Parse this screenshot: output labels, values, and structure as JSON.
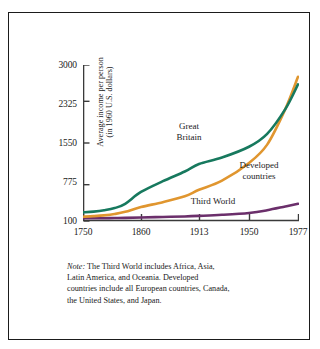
{
  "chart_data": {
    "type": "line",
    "title": "",
    "xlabel": "",
    "ylabel": "Average income per person (in 1960 U.S. dollars)",
    "ylabel_line1": "Average income per person",
    "ylabel_line2": "(in 1960 U.S. dollars)",
    "x_tick_labels": [
      "1750",
      "1860",
      "1913",
      "1950",
      "1977"
    ],
    "x_tick_values": [
      1750,
      1860,
      1913,
      1950,
      1977
    ],
    "y_tick_labels": [
      "100",
      "775",
      "1550",
      "2325",
      "3000"
    ],
    "y_tick_values": [
      100,
      775,
      1550,
      2325,
      3000
    ],
    "xlim": [
      1750,
      1977
    ],
    "ylim": [
      100,
      3000
    ],
    "grid": false,
    "legend_position": "inline-annotations",
    "series": [
      {
        "name": "Great Britain",
        "color": "#17795e",
        "x": [
          1750,
          1770,
          1790,
          1810,
          1830,
          1860,
          1880,
          1900,
          1913,
          1930,
          1950,
          1960,
          1970,
          1977
        ],
        "values": [
          260,
          275,
          300,
          340,
          420,
          640,
          840,
          1020,
          1160,
          1280,
          1480,
          1720,
          2180,
          2640
        ]
      },
      {
        "name": "Developed countries",
        "color": "#e0962f",
        "x": [
          1750,
          1770,
          1790,
          1810,
          1830,
          1860,
          1880,
          1900,
          1913,
          1930,
          1950,
          1960,
          1970,
          1977
        ],
        "values": [
          180,
          190,
          205,
          230,
          270,
          360,
          450,
          560,
          680,
          850,
          1180,
          1520,
          2180,
          2780
        ]
      },
      {
        "name": "Third World",
        "color": "#6b2f6b",
        "x": [
          1750,
          1770,
          1790,
          1810,
          1830,
          1860,
          1880,
          1900,
          1913,
          1930,
          1950,
          1960,
          1970,
          1977
        ],
        "values": [
          150,
          150,
          152,
          155,
          158,
          165,
          175,
          185,
          195,
          215,
          250,
          300,
          370,
          420
        ]
      }
    ],
    "annotations": [
      {
        "name": "Great Britain",
        "line1": "Great",
        "line2": "Britain"
      },
      {
        "name": "Developed countries",
        "line1": "Developed",
        "line2": "countries"
      },
      {
        "name": "Third World",
        "line1": "Third World",
        "line2": ""
      }
    ]
  },
  "axis": {
    "y_title_line1": "Average income per person",
    "y_title_line2": "(in 1960 U.S. dollars)",
    "y_labels": {
      "t3000": "3000",
      "t2325": "2325",
      "t1550": "1550",
      "t775": "775",
      "t100": "100"
    },
    "x_labels": {
      "t1750": "1750",
      "t1860": "1860",
      "t1913": "1913",
      "t1950": "1950",
      "t1977": "1977"
    }
  },
  "annotations": {
    "great_britain_line1": "Great",
    "great_britain_line2": "Britain",
    "developed_line1": "Developed",
    "developed_line2": "countries",
    "third_world": "Third World"
  },
  "note": {
    "lead": "Note:",
    "line1": " The Third World includes Africa, Asia,",
    "line2": "Latin America, and Oceania. Developed",
    "line3": "countries include all European countries, Canada,",
    "line4": "the United States, and Japan."
  },
  "colors": {
    "great_britain": "#17795e",
    "developed_countries": "#e0962f",
    "third_world": "#6b2f6b",
    "axis": "#3a3a3a",
    "frame": "#1b1b1b",
    "background": "#ffffff"
  }
}
